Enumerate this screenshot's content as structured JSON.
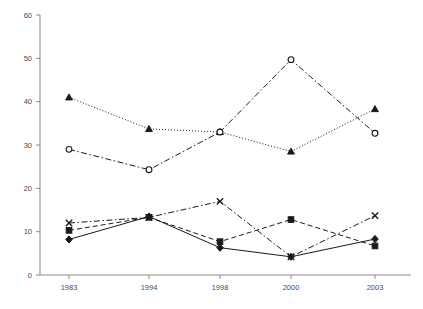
{
  "chart_data": {
    "type": "line",
    "title": "",
    "subtitle": "",
    "xlabel": "",
    "ylabel": "",
    "categories": [
      "1983",
      "1994",
      "1998",
      "2000",
      "2003"
    ],
    "ylim": [
      0,
      60
    ],
    "yticks": [
      "0",
      "10",
      "20",
      "30",
      "40",
      "50",
      "60"
    ],
    "ytick_values": [
      0,
      10,
      20,
      30,
      40,
      50,
      60
    ],
    "grid": false,
    "legend": "none",
    "series": [
      {
        "name": "triangle-series",
        "marker": "triangle",
        "marker_fill": "solid",
        "line_style": "dotted",
        "color": "#1a1a1a",
        "values": [
          41.0,
          33.7,
          33.0,
          28.5,
          38.3
        ]
      },
      {
        "name": "circle-series",
        "marker": "circle",
        "marker_fill": "open",
        "line_style": "dash-dot",
        "color": "#1a1a1a",
        "values": [
          29.0,
          24.3,
          33.0,
          49.7,
          32.7
        ]
      },
      {
        "name": "cross-series",
        "marker": "x",
        "marker_fill": "open",
        "line_style": "dash-dot",
        "color": "#1a1a1a",
        "values": [
          12.0,
          13.3,
          17.0,
          4.2,
          13.7
        ]
      },
      {
        "name": "square-series",
        "marker": "square",
        "marker_fill": "solid",
        "line_style": "dashed",
        "color": "#1a1a1a",
        "values": [
          10.3,
          13.3,
          7.7,
          12.8,
          6.7
        ]
      },
      {
        "name": "diamond-series",
        "marker": "diamond",
        "marker_fill": "solid",
        "line_style": "solid",
        "color": "#1a1a1a",
        "values": [
          8.2,
          13.5,
          6.3,
          4.2,
          8.3
        ]
      }
    ]
  },
  "axis": {
    "axis_color": "#8c8c8c",
    "label_color": "#4a4a4a"
  }
}
